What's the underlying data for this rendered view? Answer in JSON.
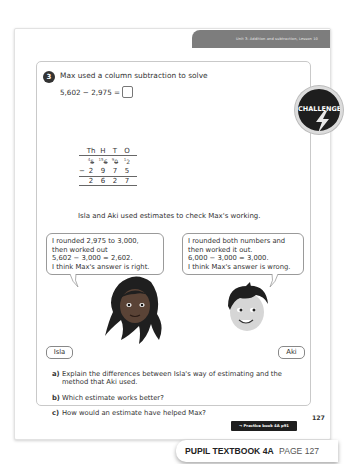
{
  "header": {
    "unit_band": "Unit 3: Addition and subtraction, Lesson 10"
  },
  "question": {
    "number": "3",
    "text": "Max used a column subtraction to solve",
    "equation": "5,602 − 2,975 =",
    "badge": "CHALLENGE"
  },
  "column_subtraction": {
    "headers": [
      "Th",
      "H",
      "T",
      "O"
    ],
    "top_row": [
      {
        "crossed": "5",
        "new": "4"
      },
      {
        "crossed": "6",
        "new": "15"
      },
      {
        "crossed": "0",
        "new": "9"
      },
      {
        "crossed": "",
        "new": "12",
        "digit": "2"
      }
    ],
    "subtract_sign": "−",
    "subtrahend": [
      "2",
      "9",
      "7",
      "5"
    ],
    "answer": [
      "2",
      "6",
      "2",
      "7"
    ]
  },
  "intro": "Isla and Aki used estimates to check Max's working.",
  "isla": {
    "name": "Isla",
    "speech": [
      "I rounded 2,975 to 3,000,",
      "then worked out",
      "5,602 − 3,000 = 2,602.",
      "I think Max's answer is right."
    ]
  },
  "aki": {
    "name": "Aki",
    "speech": [
      "I rounded both numbers and",
      "then worked it out.",
      "6,000 − 3,000 = 3,000.",
      "I think Max's answer is wrong."
    ]
  },
  "parts": [
    {
      "label": "a)",
      "text": "Explain the differences between Isla's way of estimating and the method that Aki used."
    },
    {
      "label": "b)",
      "text": "Which estimate works better?"
    },
    {
      "label": "c)",
      "text": "How would an estimate have helped Max?"
    }
  ],
  "footer": {
    "practice_tag": "→ Practice book 4A p91",
    "page_number": "127",
    "book_label": "PUPIL TEXTBOOK 4A",
    "page_label": "PAGE 127"
  },
  "colors": {
    "band": "#7d7d7d",
    "badge": "#1e1e1e",
    "text": "#333333"
  }
}
